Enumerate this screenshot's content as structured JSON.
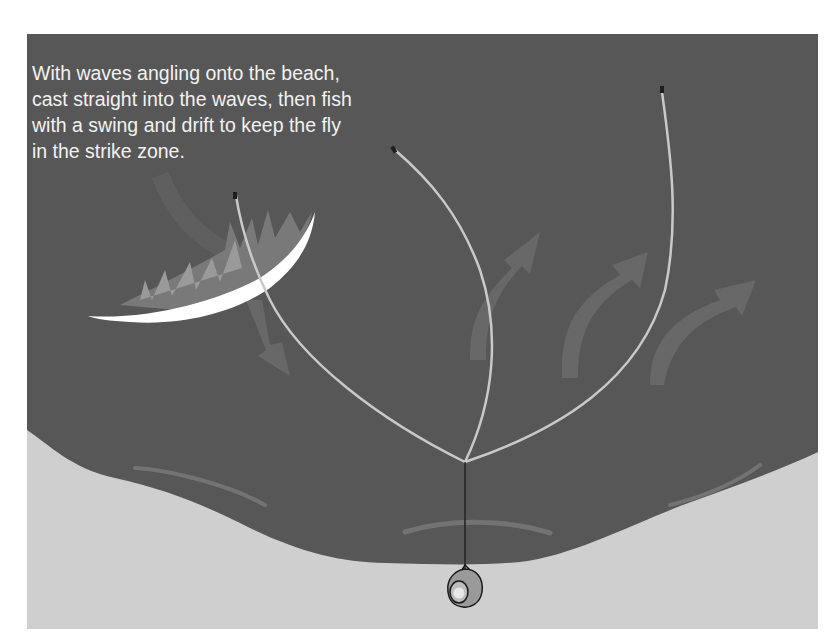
{
  "diagram": {
    "caption_lines": [
      "With waves angling onto the beach,",
      "cast straight into the waves, then fish",
      "with a swing and drift to keep the fly",
      "in the strike zone."
    ],
    "colors": {
      "water": "#575757",
      "sand": "#cfcfcf",
      "fly_line": "#c9c9c9",
      "wave_crest": "#ffffff",
      "current_arrow": "#6e6e6e",
      "leader": "#222222"
    },
    "elements": {
      "angler": "angler-top-view",
      "casts": [
        "cast-left-into-wave",
        "cast-center",
        "cast-right"
      ],
      "current_arrows": [
        "arrow-down-from-wave",
        "arrow-up-center",
        "arrow-up-right-1",
        "arrow-up-right-2"
      ],
      "wave": "breaking-wave-crest",
      "shore_ripples": 4
    }
  }
}
